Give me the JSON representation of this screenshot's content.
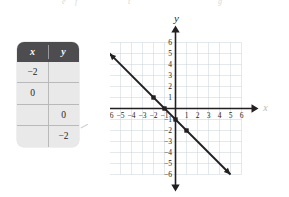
{
  "top_artifact": {
    "fragments": [
      "e",
      "f",
      "t",
      "g"
    ]
  },
  "table": {
    "headers": [
      "x",
      "y"
    ],
    "rows": [
      {
        "x": "−2",
        "y": ""
      },
      {
        "x": "0",
        "y": ""
      },
      {
        "x": "",
        "y": "0"
      },
      {
        "x": "",
        "y": "−2"
      }
    ],
    "header_bg": "#4d4d4f",
    "body_bg": "#e9e9e9",
    "header_text_color": "#ffffff"
  },
  "chart_data": {
    "type": "line",
    "title": "",
    "xlabel": "x",
    "ylabel": "y",
    "xlim": [
      -6,
      6
    ],
    "ylim": [
      -6,
      6
    ],
    "grid": true,
    "grid_color": "#c9d3dd",
    "axis_color": "#231f20",
    "line_color": "#231f20",
    "x_ticks": [
      -6,
      -5,
      -4,
      -3,
      -2,
      -1,
      1,
      2,
      3,
      4,
      5,
      6
    ],
    "y_ticks": [
      6,
      5,
      4,
      3,
      2,
      1,
      -1,
      -2,
      -3,
      -4,
      -5,
      -6
    ],
    "x_tick_labels": [
      "−6",
      "−5",
      "−4",
      "−3",
      "−2",
      "−1",
      "1",
      "2",
      "3",
      "4",
      "5",
      "6"
    ],
    "y_tick_labels": [
      "6",
      "5",
      "4",
      "3",
      "2",
      "1",
      "−1",
      "−2",
      "−3",
      "−4",
      "−5",
      "−6"
    ],
    "series": [
      {
        "name": "y = -x - 1",
        "slope": -1,
        "intercept": -1,
        "arrow_start": [
          -6,
          5
        ],
        "arrow_end": [
          5,
          -6
        ],
        "points": [
          {
            "x": -2,
            "y": 1
          },
          {
            "x": -1,
            "y": 0
          },
          {
            "x": 0,
            "y": -1
          },
          {
            "x": 1,
            "y": -2
          }
        ]
      }
    ]
  }
}
